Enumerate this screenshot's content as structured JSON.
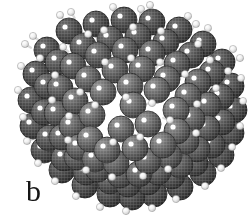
{
  "figure": {
    "panel_label": "b",
    "background_color": "#ffffff",
    "width": 252,
    "height": 224,
    "rendering_style": "halftone-dithered grayscale scan"
  },
  "cluster": {
    "center_x": 128,
    "center_y": 107,
    "radius": 108,
    "silhouette_left": 20,
    "silhouette_right": 236,
    "silhouette_top": 8,
    "silhouette_bottom": 207
  },
  "atoms": {
    "heavy": {
      "name": "silicon-atom",
      "radius": 13,
      "base_color": "#5f5f5f",
      "light_color": "#8c8c8c",
      "dark_color": "#3a3a3a",
      "rim_color": "#2b2b2b",
      "highlight_color": "#ffffff",
      "highlight_radius": 2.6,
      "highlight_offset_x": -4,
      "highlight_offset_y": -4
    },
    "light": {
      "name": "hydrogen-atom",
      "radius": 3.6,
      "base_color": "#f2f2f2",
      "light_color": "#ffffff",
      "dark_color": "#b9b9b9",
      "rim_color": "#8f8f8f",
      "bond_color": "#d8d8d8",
      "bond_width": 2.4
    }
  },
  "lattice": {
    "description": "diamond-cubic rows running diagonally, front facets brighter than receding rows",
    "row_depth_shades": [
      "#7a7a7a",
      "#6c6c6c",
      "#606060",
      "#555555",
      "#4a4a4a"
    ]
  },
  "chart_data": {
    "type": "scatter",
    "title": "",
    "xlabel": "",
    "ylabel": "",
    "note": "Projected 2-D positions of rendered atom spheres in panel b (image pixel coordinates, y down). r = drawn sphere radius in px, depth = painter-order layer (0 = farthest).",
    "xlim": [
      0,
      252
    ],
    "ylim": [
      224,
      0
    ],
    "grid": false,
    "legend": "none",
    "series": [
      {
        "name": "silicon",
        "points": [
          [
            69,
            31,
            13,
            0
          ],
          [
            96,
            24,
            13,
            0
          ],
          [
            124,
            20,
            13,
            0
          ],
          [
            152,
            22,
            13,
            0
          ],
          [
            179,
            30,
            13,
            0
          ],
          [
            203,
            44,
            13,
            0
          ],
          [
            47,
            50,
            13,
            0
          ],
          [
            222,
            62,
            13,
            0
          ],
          [
            36,
            74,
            13,
            0
          ],
          [
            231,
            86,
            13,
            0
          ],
          [
            31,
            100,
            13,
            0
          ],
          [
            234,
            110,
            13,
            0
          ],
          [
            33,
            126,
            13,
            0
          ],
          [
            231,
            133,
            13,
            0
          ],
          [
            44,
            150,
            13,
            0
          ],
          [
            221,
            155,
            13,
            0
          ],
          [
            62,
            170,
            13,
            0
          ],
          [
            203,
            173,
            13,
            0
          ],
          [
            85,
            185,
            13,
            0
          ],
          [
            180,
            187,
            13,
            0
          ],
          [
            110,
            194,
            13,
            0
          ],
          [
            154,
            194,
            13,
            0
          ],
          [
            132,
            197,
            13,
            0
          ],
          [
            83,
            46,
            13,
            1
          ],
          [
            110,
            39,
            13,
            1
          ],
          [
            138,
            36,
            13,
            1
          ],
          [
            166,
            42,
            13,
            1
          ],
          [
            191,
            55,
            13,
            1
          ],
          [
            58,
            62,
            13,
            1
          ],
          [
            212,
            73,
            13,
            1
          ],
          [
            47,
            86,
            13,
            1
          ],
          [
            221,
            97,
            13,
            1
          ],
          [
            44,
            112,
            13,
            1
          ],
          [
            222,
            122,
            13,
            1
          ],
          [
            49,
            138,
            13,
            1
          ],
          [
            212,
            145,
            13,
            1
          ],
          [
            64,
            158,
            13,
            1
          ],
          [
            195,
            163,
            13,
            1
          ],
          [
            86,
            172,
            13,
            1
          ],
          [
            172,
            176,
            13,
            1
          ],
          [
            110,
            181,
            13,
            1
          ],
          [
            148,
            182,
            13,
            1
          ],
          [
            128,
            184,
            13,
            1
          ],
          [
            98,
            55,
            13,
            2
          ],
          [
            125,
            50,
            13,
            2
          ],
          [
            152,
            53,
            13,
            2
          ],
          [
            177,
            64,
            13,
            2
          ],
          [
            73,
            66,
            13,
            2
          ],
          [
            198,
            82,
            13,
            2
          ],
          [
            60,
            88,
            13,
            2
          ],
          [
            208,
            105,
            13,
            2
          ],
          [
            57,
            113,
            13,
            2
          ],
          [
            207,
            128,
            13,
            2
          ],
          [
            62,
            137,
            13,
            2
          ],
          [
            197,
            149,
            13,
            2
          ],
          [
            77,
            157,
            13,
            2
          ],
          [
            180,
            165,
            13,
            2
          ],
          [
            98,
            169,
            13,
            2
          ],
          [
            158,
            172,
            13,
            2
          ],
          [
            120,
            175,
            13,
            2
          ],
          [
            139,
            174,
            13,
            2
          ],
          [
            88,
            79,
            13,
            3
          ],
          [
            115,
            70,
            13,
            3
          ],
          [
            142,
            69,
            13,
            3
          ],
          [
            167,
            79,
            13,
            3
          ],
          [
            75,
            101,
            13,
            3
          ],
          [
            188,
            96,
            13,
            3
          ],
          [
            72,
            126,
            13,
            3
          ],
          [
            192,
            119,
            13,
            3
          ],
          [
            79,
            147,
            13,
            3
          ],
          [
            186,
            141,
            13,
            3
          ],
          [
            95,
            159,
            13,
            3
          ],
          [
            169,
            156,
            13,
            3
          ],
          [
            116,
            163,
            13,
            3
          ],
          [
            148,
            161,
            13,
            3
          ],
          [
            103,
            92,
            13,
            4
          ],
          [
            130,
            86,
            13,
            4
          ],
          [
            157,
            90,
            13,
            4
          ],
          [
            92,
            115,
            13,
            4
          ],
          [
            176,
            110,
            13,
            4
          ],
          [
            90,
            139,
            13,
            4
          ],
          [
            177,
            131,
            13,
            4
          ],
          [
            107,
            150,
            13,
            4
          ],
          [
            163,
            145,
            13,
            4
          ],
          [
            133,
            105,
            13,
            4
          ],
          [
            121,
            129,
            13,
            4
          ],
          [
            148,
            124,
            13,
            4
          ],
          [
            135,
            148,
            13,
            4
          ]
        ]
      },
      {
        "name": "hydrogen",
        "points": [
          [
            60,
            15,
            3.6
          ],
          [
            71,
            12,
            3.6
          ],
          [
            113,
            7,
            3.6
          ],
          [
            141,
            9,
            3.6
          ],
          [
            150,
            5,
            3.6
          ],
          [
            188,
            16,
            3.6
          ],
          [
            196,
            24,
            3.6
          ],
          [
            208,
            28,
            3.6
          ],
          [
            33,
            36,
            3.6
          ],
          [
            25,
            44,
            3.6
          ],
          [
            40,
            58,
            3.6
          ],
          [
            233,
            49,
            3.6
          ],
          [
            240,
            58,
            3.6
          ],
          [
            228,
            71,
            3.6
          ],
          [
            21,
            66,
            3.6
          ],
          [
            18,
            90,
            3.6
          ],
          [
            23,
            117,
            3.6
          ],
          [
            241,
            78,
            3.6
          ],
          [
            243,
            101,
            3.6
          ],
          [
            240,
            126,
            3.6
          ],
          [
            27,
            141,
            3.6
          ],
          [
            38,
            163,
            3.6
          ],
          [
            55,
            181,
            3.6
          ],
          [
            232,
            147,
            3.6
          ],
          [
            221,
            168,
            3.6
          ],
          [
            205,
            186,
            3.6
          ],
          [
            76,
            196,
            3.6
          ],
          [
            100,
            207,
            3.6
          ],
          [
            126,
            211,
            3.6
          ],
          [
            152,
            208,
            3.6
          ],
          [
            176,
            199,
            3.6
          ],
          [
            88,
            34,
            3.6
          ],
          [
            104,
            30,
            3.6
          ],
          [
            133,
            27,
            3.6
          ],
          [
            161,
            31,
            3.6
          ],
          [
            63,
            47,
            3.6
          ],
          [
            55,
            75,
            3.6
          ],
          [
            52,
            100,
            3.6
          ],
          [
            198,
            44,
            3.6
          ],
          [
            210,
            60,
            3.6
          ],
          [
            216,
            88,
            3.6
          ],
          [
            105,
            62,
            3.6
          ],
          [
            131,
            58,
            3.6
          ],
          [
            160,
            62,
            3.6
          ],
          [
            80,
            92,
            3.6
          ],
          [
            69,
            116,
            3.6
          ],
          [
            68,
            140,
            3.6
          ],
          [
            185,
            74,
            3.6
          ],
          [
            197,
            104,
            3.6
          ],
          [
            196,
            133,
            3.6
          ],
          [
            95,
            105,
            3.6
          ],
          [
            113,
            142,
            3.6
          ],
          [
            140,
            137,
            3.6
          ],
          [
            152,
            103,
            3.6
          ],
          [
            126,
            97,
            3.6
          ],
          [
            170,
            120,
            3.6
          ],
          [
            86,
            170,
            3.6
          ],
          [
            112,
            177,
            3.6
          ],
          [
            143,
            176,
            3.6
          ],
          [
            168,
            169,
            3.6
          ]
        ]
      }
    ]
  }
}
